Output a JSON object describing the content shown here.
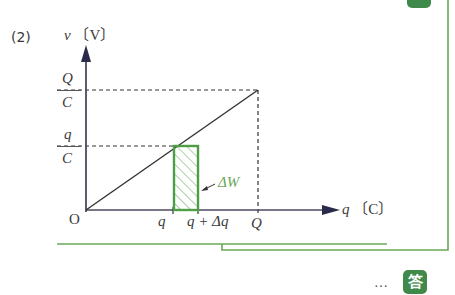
{
  "problem": {
    "number_label": "(2)",
    "answer_badge": "答",
    "answer_prefix": "…"
  },
  "axes": {
    "y_label": "v",
    "y_unit": "〔V〕",
    "x_label": "q",
    "x_unit": "〔C〕",
    "origin": "O"
  },
  "ticks": {
    "y_top_num": "Q",
    "y_top_den": "C",
    "y_mid_num": "q",
    "y_mid_den": "C",
    "x_q": "q",
    "x_q_dq": "q + Δq",
    "x_Q": "Q"
  },
  "annotation": {
    "delta_w": "ΔW"
  },
  "colors": {
    "green": "#4f9e45",
    "light_green": "#7cb56f",
    "axis": "#3a3a55",
    "text": "#3a3a3a"
  }
}
